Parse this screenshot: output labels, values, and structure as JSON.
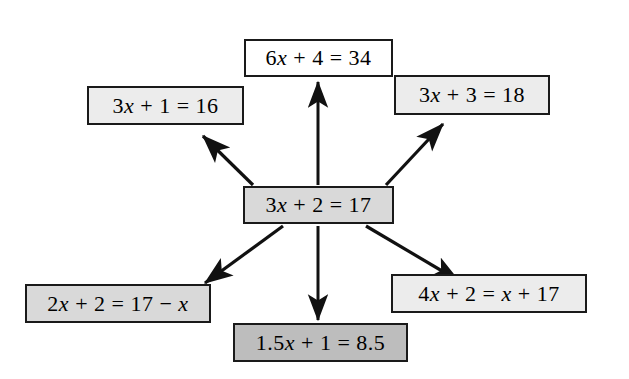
{
  "diagram": {
    "colors": {
      "stroke": "#1a1a1a",
      "fill_white": "#ffffff",
      "fill_light": "#ececec",
      "fill_mid": "#d9d9d9",
      "fill_dark": "#bdbdbd",
      "background": "#ffffff"
    },
    "center": {
      "id": "center",
      "equation": "3x + 2 = 17",
      "shade": "mid"
    },
    "nodes": [
      {
        "id": "top",
        "equation": "6x + 4 = 34",
        "shade": "white"
      },
      {
        "id": "upper-left",
        "equation": "3x + 1 = 16",
        "shade": "light"
      },
      {
        "id": "upper-right",
        "equation": "3x + 3 = 18",
        "shade": "light"
      },
      {
        "id": "lower-left",
        "equation": "2x + 2 = 17 − x",
        "shade": "mid"
      },
      {
        "id": "bottom",
        "equation": "1.5x + 1 = 8.5",
        "shade": "dark"
      },
      {
        "id": "lower-right",
        "equation": "4x + 2 = x + 17",
        "shade": "light"
      }
    ],
    "arrows": [
      {
        "id": "arrow-to-top",
        "from": "center",
        "to": "top",
        "heads": 1,
        "direction": "up"
      },
      {
        "id": "arrow-to-upper-left",
        "from": "center",
        "to": "upper-left",
        "heads": 1,
        "direction": "up-left"
      },
      {
        "id": "arrow-to-upper-right",
        "from": "center",
        "to": "upper-right",
        "heads": 1,
        "direction": "up-right"
      },
      {
        "id": "arrow-to-lower-left",
        "from": "center",
        "to": "lower-left",
        "heads": 1,
        "direction": "down-left"
      },
      {
        "id": "arrow-to-bottom",
        "from": "center",
        "to": "bottom",
        "heads": 1,
        "direction": "down"
      },
      {
        "id": "arrow-to-lower-right",
        "from": "center",
        "to": "lower-right",
        "heads": 1,
        "direction": "down-right"
      }
    ]
  }
}
